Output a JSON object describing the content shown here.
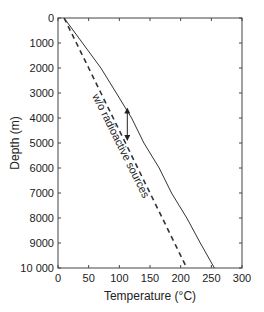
{
  "chart_data": {
    "type": "line",
    "title": "",
    "xlabel": "Temperature (°C)",
    "ylabel": "Depth (m)",
    "xlim": [
      0,
      300
    ],
    "ylim": [
      0,
      10000
    ],
    "y_inverted": true,
    "grid": false,
    "x_ticks": [
      0,
      50,
      100,
      150,
      200,
      250,
      300
    ],
    "y_ticks": [
      0,
      1000,
      2000,
      3000,
      4000,
      5000,
      6000,
      7000,
      8000,
      9000,
      10000
    ],
    "y_tick_labels": [
      "0",
      "1000",
      "2000",
      "3000",
      "4000",
      "5000",
      "6000",
      "7000",
      "8000",
      "9000",
      "10 000"
    ],
    "series": [
      {
        "name": "with radioactive sources",
        "style": "solid",
        "points": [
          [
            10,
            0
          ],
          [
            40,
            1000
          ],
          [
            70,
            2000
          ],
          [
            95,
            3000
          ],
          [
            120,
            4000
          ],
          [
            140,
            5000
          ],
          [
            165,
            6000
          ],
          [
            185,
            7000
          ],
          [
            210,
            8000
          ],
          [
            232,
            9000
          ],
          [
            255,
            10000
          ]
        ]
      },
      {
        "name": "w/o radioactive sources",
        "style": "dashed",
        "points": [
          [
            10,
            0
          ],
          [
            30,
            1000
          ],
          [
            50,
            2000
          ],
          [
            70,
            3000
          ],
          [
            90,
            4000
          ],
          [
            110,
            5000
          ],
          [
            130,
            6000
          ],
          [
            150,
            7000
          ],
          [
            170,
            8000
          ],
          [
            190,
            9000
          ],
          [
            210,
            10000
          ]
        ]
      }
    ],
    "annotations": [
      {
        "text": "w/o radioactive sources",
        "type": "rotated-label",
        "near_series": "w/o radioactive sources"
      },
      {
        "type": "double-arrow",
        "x": 113,
        "y_from": 3700,
        "y_to": 4800
      }
    ]
  }
}
